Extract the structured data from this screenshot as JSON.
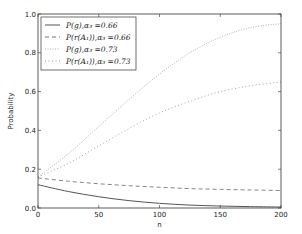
{
  "chart_data": {
    "type": "line",
    "title": "",
    "xlabel": "n",
    "ylabel": "Probability",
    "xlim": [
      0,
      200
    ],
    "ylim": [
      0.0,
      1.0
    ],
    "xticks": [
      0,
      50,
      100,
      150,
      200
    ],
    "xtick_labels": [
      "0",
      "50",
      "100",
      "150",
      "200"
    ],
    "yticks": [
      0.0,
      0.2,
      0.4,
      0.6,
      0.8,
      1.0
    ],
    "ytick_labels": [
      "0.0",
      "0.2",
      "0.4",
      "0.6",
      "0.8",
      "1.0"
    ],
    "grid": false,
    "legend_position": "upper left",
    "x": [
      0,
      25,
      50,
      75,
      100,
      125,
      150,
      175,
      200
    ],
    "series": [
      {
        "name": "P(g),α3=0.66",
        "style": "solid",
        "color": "#555555",
        "values": [
          0.12,
          0.085,
          0.058,
          0.038,
          0.024,
          0.015,
          0.01,
          0.007,
          0.005
        ]
      },
      {
        "name": "P(r(A1)),α3=0.66",
        "style": "dashed",
        "color": "#777777",
        "values": [
          0.155,
          0.138,
          0.125,
          0.115,
          0.107,
          0.1,
          0.096,
          0.093,
          0.09
        ]
      },
      {
        "name": "P(g),α3=0.73",
        "style": "dotted",
        "color": "#aaaaaa",
        "values": [
          0.16,
          0.28,
          0.42,
          0.56,
          0.69,
          0.8,
          0.88,
          0.93,
          0.95
        ]
      },
      {
        "name": "P(r(A1)),α3=0.73",
        "style": "dashdot",
        "color": "#999999",
        "values": [
          0.16,
          0.23,
          0.32,
          0.41,
          0.49,
          0.55,
          0.6,
          0.63,
          0.65
        ]
      }
    ]
  },
  "legend": {
    "entries": [
      {
        "label": "P(g),α₃ =0.66"
      },
      {
        "label": "P(r(A₁)),α₃ =0.66"
      },
      {
        "label": "P(g),α₃ =0.73"
      },
      {
        "label": "P(r(A₁)),α₃ =0.73"
      }
    ]
  },
  "axes": {
    "xlabel": "n",
    "ylabel": "Probability"
  }
}
